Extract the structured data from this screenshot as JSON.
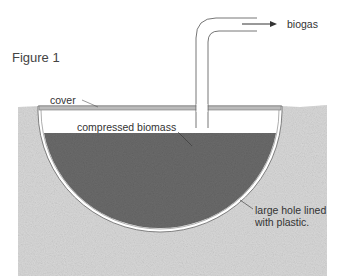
{
  "figure": {
    "title": "Figure 1"
  },
  "labels": {
    "biogas": "biogas",
    "cover": "cover",
    "compressed_biomass": "compressed biomass",
    "hole_line1": "large hole lined",
    "hole_line2": "with plastic."
  },
  "colors": {
    "ground": "#d6d6d6",
    "biomass": "#6e6e6e",
    "cover": "#b8b8b8",
    "liner": "#ffffff",
    "line": "#555555"
  }
}
